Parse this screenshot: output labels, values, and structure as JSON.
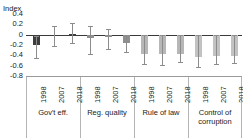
{
  "chart_data": {
    "type": "bar",
    "title": "",
    "ylabel": "Index",
    "xlabel": "",
    "ylim": [
      -0.8,
      0.4
    ],
    "yticks": [
      "0.4",
      "0.2",
      "0",
      "-0.2",
      "-0.4",
      "-0.6",
      "-0.8"
    ],
    "ytick_values": [
      0.4,
      0.2,
      0,
      -0.2,
      -0.4,
      -0.6,
      -0.8
    ],
    "grid": false,
    "legend": "none",
    "categories": [
      "Gov't eff.",
      "Reg. quality",
      "Rule of law",
      "Control of corruption"
    ],
    "subcategories": [
      "1998",
      "2007",
      "2018"
    ],
    "error_bars": true,
    "groups": [
      {
        "name": "Gov't eff.",
        "color": "#3d3d3d",
        "bars": [
          {
            "year": "1998",
            "value": -0.2,
            "err_low": -0.45,
            "err_high": -0.02
          },
          {
            "year": "2007",
            "value": -0.03,
            "err_low": -0.22,
            "err_high": 0.17
          },
          {
            "year": "2018",
            "value": 0.02,
            "err_low": -0.17,
            "err_high": 0.23
          }
        ]
      },
      {
        "name": "Reg. quality",
        "color": "#8f8f8f",
        "bars": [
          {
            "year": "1998",
            "value": -0.06,
            "err_low": -0.38,
            "err_high": 0.17
          },
          {
            "year": "2007",
            "value": -0.05,
            "err_low": -0.27,
            "err_high": 0.11
          },
          {
            "year": "2018",
            "value": -0.17,
            "err_low": -0.33,
            "err_high": -0.01
          }
        ]
      },
      {
        "name": "Rule of law",
        "color": "#b7b7b7",
        "bars": [
          {
            "year": "1998",
            "value": -0.38,
            "err_low": -0.56,
            "err_high": -0.01
          },
          {
            "year": "2007",
            "value": -0.37,
            "err_low": -0.58,
            "err_high": -0.01
          },
          {
            "year": "2018",
            "value": -0.37,
            "err_low": -0.52,
            "err_high": -0.01
          }
        ]
      },
      {
        "name": "Control of corruption",
        "color": "#c2c2c2",
        "bars": [
          {
            "year": "1998",
            "value": -0.43,
            "err_low": -0.63,
            "err_high": -0.01
          },
          {
            "year": "2007",
            "value": -0.42,
            "err_low": -0.57,
            "err_high": -0.01
          },
          {
            "year": "2018",
            "value": -0.42,
            "err_low": -0.55,
            "err_high": -0.01
          }
        ]
      }
    ]
  }
}
